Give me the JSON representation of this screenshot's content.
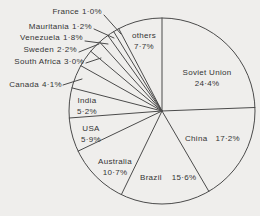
{
  "figure": {
    "background_color": "#efeeec",
    "line_color": "#4b4b4b",
    "text_color": "#343434"
  },
  "chart_data": {
    "type": "pie",
    "title": "",
    "unit": "%",
    "start_angle_clockwise_from_top": 0,
    "direction": "clockwise",
    "legend": "none",
    "categories": [
      "Soviet Union",
      "China",
      "Brazil",
      "Australia",
      "USA",
      "India",
      "Canada",
      "South Africa",
      "Sweden",
      "Venezuela",
      "Mauritania",
      "France",
      "others"
    ],
    "values": [
      24.4,
      17.2,
      15.6,
      10.7,
      5.9,
      5.2,
      4.1,
      3.0,
      2.2,
      1.8,
      1.2,
      1.0,
      7.7
    ],
    "slices": [
      {
        "label": "Soviet Union",
        "value": 24.4,
        "pct_text": "24·4%",
        "label_placement": "inside"
      },
      {
        "label": "China",
        "value": 17.2,
        "pct_text": "17·2%",
        "label_placement": "inside"
      },
      {
        "label": "Brazil",
        "value": 15.6,
        "pct_text": "15·6%",
        "label_placement": "inside"
      },
      {
        "label": "Australia",
        "value": 10.7,
        "pct_text": "10·7%",
        "label_placement": "inside"
      },
      {
        "label": "USA",
        "value": 5.9,
        "pct_text": "5·9%",
        "label_placement": "inside"
      },
      {
        "label": "India",
        "value": 5.2,
        "pct_text": "5·2%",
        "label_placement": "inside"
      },
      {
        "label": "Canada",
        "value": 4.1,
        "pct_text": "4·1%",
        "label_placement": "outside-left"
      },
      {
        "label": "South Africa",
        "value": 3.0,
        "pct_text": "3·0%",
        "label_placement": "outside-left"
      },
      {
        "label": "Sweden",
        "value": 2.2,
        "pct_text": "2·2%",
        "label_placement": "outside-left"
      },
      {
        "label": "Venezuela",
        "value": 1.8,
        "pct_text": "1·8%",
        "label_placement": "outside-left"
      },
      {
        "label": "Mauritania",
        "value": 1.2,
        "pct_text": "1·2%",
        "label_placement": "outside-left"
      },
      {
        "label": "France",
        "value": 1.0,
        "pct_text": "1·0%",
        "label_placement": "outside-left"
      },
      {
        "label": "others",
        "value": 7.7,
        "pct_text": "7·7%",
        "label_placement": "inside"
      }
    ]
  }
}
